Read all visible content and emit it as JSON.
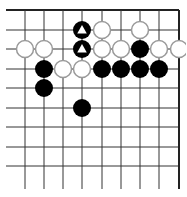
{
  "board": {
    "view": "top-right corner",
    "columns_x": [
      25,
      44,
      63,
      82,
      102,
      121,
      140,
      159,
      179
    ],
    "rows_y": [
      10,
      30,
      49,
      69,
      88,
      108,
      127,
      147,
      166
    ],
    "line_left_x": 6,
    "line_bottom_y": 189,
    "top_edge_y": 10,
    "right_edge_x": 179,
    "line_color": "#333333",
    "edge_color": "#222222",
    "stone_radius": 9,
    "colors": {
      "black": "#000000",
      "white_fill": "#ffffff",
      "white_stroke": "#9a9a9a",
      "marker_on_black": "#ffffff"
    }
  },
  "stones": [
    {
      "color": "black",
      "col": 3,
      "row": 1,
      "marker": "triangle"
    },
    {
      "color": "white",
      "col": 4,
      "row": 1
    },
    {
      "color": "white",
      "col": 6,
      "row": 1
    },
    {
      "color": "white",
      "col": 0,
      "row": 2
    },
    {
      "color": "white",
      "col": 1,
      "row": 2
    },
    {
      "color": "black",
      "col": 3,
      "row": 2,
      "marker": "triangle"
    },
    {
      "color": "white",
      "col": 4,
      "row": 2
    },
    {
      "color": "white",
      "col": 5,
      "row": 2
    },
    {
      "color": "black",
      "col": 6,
      "row": 2
    },
    {
      "color": "white",
      "col": 7,
      "row": 2
    },
    {
      "color": "white",
      "col": 8,
      "row": 2
    },
    {
      "color": "black",
      "col": 1,
      "row": 3
    },
    {
      "color": "white",
      "col": 2,
      "row": 3
    },
    {
      "color": "white",
      "col": 3,
      "row": 3
    },
    {
      "color": "black",
      "col": 4,
      "row": 3
    },
    {
      "color": "black",
      "col": 5,
      "row": 3
    },
    {
      "color": "black",
      "col": 6,
      "row": 3
    },
    {
      "color": "black",
      "col": 7,
      "row": 3
    },
    {
      "color": "black",
      "col": 1,
      "row": 4
    },
    {
      "color": "black",
      "col": 3,
      "row": 5
    }
  ]
}
